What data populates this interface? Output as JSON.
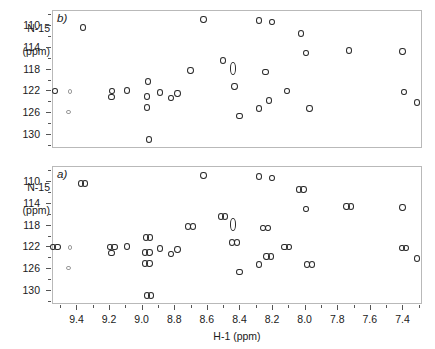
{
  "figure": {
    "type": "nmr-2d-spectrum-pair",
    "x_axis_title": "H-1 (ppm)",
    "y_axis_title_line1": "N-15",
    "y_axis_title_line2": "(ppm)"
  },
  "panels": [
    {
      "id": "b",
      "label": "b)"
    },
    {
      "id": "a",
      "label": "a)"
    }
  ],
  "chart_data": {
    "type": "scatter",
    "title": "",
    "xlabel": "H-1 (ppm)",
    "ylabel": "N-15 (ppm)",
    "xlim": [
      9.55,
      7.28
    ],
    "ylim": [
      132.6,
      107.2
    ],
    "x_inverted": true,
    "y_inverted": true,
    "grid": false,
    "legend": "none",
    "xticks": [
      "9.4",
      "9.2",
      "9.0",
      "8.8",
      "8.6",
      "8.4",
      "8.2",
      "8.0",
      "7.8",
      "7.6",
      "7.4"
    ],
    "xtick_values": [
      9.4,
      9.2,
      9.0,
      8.8,
      8.6,
      8.4,
      8.2,
      8.0,
      7.8,
      7.6,
      7.4
    ],
    "xtick_minor_step": 0.1,
    "yticks": [
      "110",
      "114",
      "118",
      "122",
      "126",
      "130"
    ],
    "ytick_values": [
      110,
      114,
      118,
      122,
      126,
      130
    ],
    "ytick_minor_step": 2,
    "series": [
      {
        "name": "b",
        "panel": "b",
        "marker": "open-ellipse",
        "note": "single (undoubled) cross peaks",
        "points": [
          {
            "x": 9.53,
            "y": 122.1,
            "size": "m"
          },
          {
            "x": 9.44,
            "y": 122.2,
            "size": "s"
          },
          {
            "x": 9.45,
            "y": 126.0,
            "size": "s"
          },
          {
            "x": 9.36,
            "y": 110.4,
            "size": "m"
          },
          {
            "x": 9.18,
            "y": 122.1,
            "size": "m"
          },
          {
            "x": 9.185,
            "y": 123.2,
            "size": "m"
          },
          {
            "x": 9.09,
            "y": 122.0,
            "size": "m"
          },
          {
            "x": 8.96,
            "y": 120.3,
            "size": "m"
          },
          {
            "x": 8.965,
            "y": 123.1,
            "size": "m"
          },
          {
            "x": 8.965,
            "y": 125.1,
            "size": "m"
          },
          {
            "x": 8.955,
            "y": 131.0,
            "size": "m"
          },
          {
            "x": 8.885,
            "y": 122.4,
            "size": "m"
          },
          {
            "x": 8.82,
            "y": 123.4,
            "size": "m"
          },
          {
            "x": 8.78,
            "y": 122.6,
            "size": "m"
          },
          {
            "x": 8.7,
            "y": 118.3,
            "size": "m"
          },
          {
            "x": 8.62,
            "y": 108.9,
            "size": "m"
          },
          {
            "x": 8.5,
            "y": 116.5,
            "size": "m"
          },
          {
            "x": 8.44,
            "y": 118.0,
            "size": "tall"
          },
          {
            "x": 8.43,
            "y": 121.3,
            "size": "m"
          },
          {
            "x": 8.4,
            "y": 126.7,
            "size": "m"
          },
          {
            "x": 8.28,
            "y": 109.1,
            "size": "m"
          },
          {
            "x": 8.28,
            "y": 125.4,
            "size": "m"
          },
          {
            "x": 8.24,
            "y": 118.6,
            "size": "m"
          },
          {
            "x": 8.22,
            "y": 123.9,
            "size": "m"
          },
          {
            "x": 8.2,
            "y": 109.4,
            "size": "m"
          },
          {
            "x": 8.11,
            "y": 122.1,
            "size": "m"
          },
          {
            "x": 8.02,
            "y": 111.5,
            "size": "m"
          },
          {
            "x": 7.99,
            "y": 115.1,
            "size": "m"
          },
          {
            "x": 7.97,
            "y": 125.4,
            "size": "m"
          },
          {
            "x": 7.73,
            "y": 114.6,
            "size": "m"
          },
          {
            "x": 7.4,
            "y": 114.8,
            "size": "m"
          },
          {
            "x": 7.39,
            "y": 122.3,
            "size": "m"
          },
          {
            "x": 7.31,
            "y": 124.2,
            "size": "m"
          }
        ]
      },
      {
        "name": "a",
        "panel": "a",
        "marker": "open-ellipse-doublet",
        "note": "doubled (split) cross peaks",
        "points": [
          {
            "x": 9.53,
            "y": 122.1,
            "size": "m",
            "doubled": true
          },
          {
            "x": 9.44,
            "y": 122.2,
            "size": "s",
            "doubled": false
          },
          {
            "x": 9.45,
            "y": 126.0,
            "size": "s",
            "doubled": false
          },
          {
            "x": 9.36,
            "y": 110.4,
            "size": "m",
            "doubled": true
          },
          {
            "x": 9.18,
            "y": 122.1,
            "size": "m",
            "doubled": true
          },
          {
            "x": 9.185,
            "y": 123.2,
            "size": "m",
            "doubled": false
          },
          {
            "x": 9.09,
            "y": 122.0,
            "size": "m",
            "doubled": false
          },
          {
            "x": 8.96,
            "y": 120.3,
            "size": "m",
            "doubled": true
          },
          {
            "x": 8.965,
            "y": 123.1,
            "size": "m",
            "doubled": true
          },
          {
            "x": 8.965,
            "y": 125.1,
            "size": "m",
            "doubled": true
          },
          {
            "x": 8.955,
            "y": 131.0,
            "size": "m",
            "doubled": true
          },
          {
            "x": 8.885,
            "y": 122.4,
            "size": "m",
            "doubled": false
          },
          {
            "x": 8.82,
            "y": 123.4,
            "size": "m",
            "doubled": false
          },
          {
            "x": 8.78,
            "y": 122.6,
            "size": "m",
            "doubled": false
          },
          {
            "x": 8.7,
            "y": 118.3,
            "size": "m",
            "doubled": true
          },
          {
            "x": 8.62,
            "y": 108.9,
            "size": "m",
            "doubled": false
          },
          {
            "x": 8.5,
            "y": 116.5,
            "size": "m",
            "doubled": true
          },
          {
            "x": 8.44,
            "y": 118.0,
            "size": "tall",
            "doubled": false
          },
          {
            "x": 8.43,
            "y": 121.3,
            "size": "m",
            "doubled": true
          },
          {
            "x": 8.4,
            "y": 126.7,
            "size": "m",
            "doubled": false
          },
          {
            "x": 8.28,
            "y": 109.1,
            "size": "m",
            "doubled": false
          },
          {
            "x": 8.28,
            "y": 125.4,
            "size": "m",
            "doubled": false
          },
          {
            "x": 8.24,
            "y": 118.6,
            "size": "m",
            "doubled": true
          },
          {
            "x": 8.22,
            "y": 123.9,
            "size": "m",
            "doubled": true
          },
          {
            "x": 8.2,
            "y": 109.4,
            "size": "m",
            "doubled": false
          },
          {
            "x": 8.11,
            "y": 122.1,
            "size": "m",
            "doubled": true
          },
          {
            "x": 8.02,
            "y": 111.5,
            "size": "m",
            "doubled": true
          },
          {
            "x": 7.99,
            "y": 115.1,
            "size": "m",
            "doubled": false
          },
          {
            "x": 7.97,
            "y": 125.4,
            "size": "m",
            "doubled": true
          },
          {
            "x": 7.73,
            "y": 114.6,
            "size": "m",
            "doubled": true
          },
          {
            "x": 7.4,
            "y": 114.8,
            "size": "m",
            "doubled": false
          },
          {
            "x": 7.39,
            "y": 122.3,
            "size": "m",
            "doubled": true
          },
          {
            "x": 7.31,
            "y": 124.2,
            "size": "m",
            "doubled": false
          }
        ]
      }
    ]
  }
}
